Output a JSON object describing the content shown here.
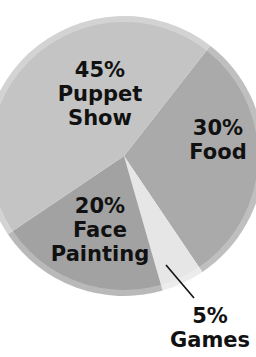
{
  "chart_data": {
    "type": "pie",
    "title": "",
    "categories": [
      "Puppet Show",
      "Food",
      "Games",
      "Face Painting"
    ],
    "values": [
      45,
      30,
      5,
      20
    ],
    "labels": [
      {
        "pct": "45%",
        "line1": "Puppet",
        "line2": "Show"
      },
      {
        "pct": "30%",
        "line1": "Food",
        "line2": ""
      },
      {
        "pct": "5%",
        "line1": "Games",
        "line2": ""
      },
      {
        "pct": "20%",
        "line1": "Face",
        "line2": "Painting"
      }
    ],
    "colors": {
      "Puppet Show": "#c4c4c4",
      "Food": "#aaaaaa",
      "Games": "#e6e6e6",
      "Face Painting": "#a2a2a2"
    },
    "legend": "none"
  }
}
